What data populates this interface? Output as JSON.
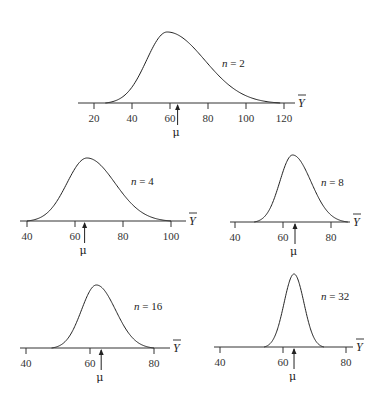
{
  "chart_data": [
    {
      "type": "line",
      "title": "n = 2",
      "n_label_var": "n",
      "n_value": 2,
      "xlabel": "Ȳ",
      "mu_label": "μ",
      "mu": 64,
      "mode": 58.5,
      "skew": "right",
      "ticks": [
        20,
        40,
        60,
        80,
        100,
        120
      ],
      "xlim": [
        17,
        125
      ],
      "curve_support": [
        26,
        118
      ],
      "layout": {
        "x0": 94,
        "units_per_px": 0.5263,
        "px_per_10": 19,
        "axis_y": 103,
        "axis_x_start": 78,
        "axis_x_end": 295,
        "peak_y": 32,
        "label_x": 222,
        "label_y": 67
      }
    },
    {
      "type": "line",
      "title": "n = 4",
      "n_label_var": "n",
      "n_value": 4,
      "xlabel": "Ȳ",
      "mu_label": "μ",
      "mu": 64,
      "mode": 65,
      "ticks": [
        40,
        60,
        80,
        100
      ],
      "xlim": [
        38,
        104
      ],
      "curve_support": [
        40,
        100
      ],
      "layout": {
        "x0": 27,
        "px_per_10": 24,
        "axis_y": 221,
        "axis_x_start": 20,
        "axis_x_end": 186,
        "peak_y": 158,
        "label_x": 131,
        "label_y": 185
      }
    },
    {
      "type": "line",
      "title": "n = 8",
      "n_label_var": "n",
      "n_value": 8,
      "xlabel": "Ȳ",
      "mu_label": "μ",
      "mu": 65,
      "mode": 64,
      "ticks": [
        40,
        60,
        80
      ],
      "xlim": [
        38,
        87
      ],
      "curve_support": [
        48,
        87
      ],
      "layout": {
        "x0": 235,
        "px_per_10": 24,
        "axis_y": 222,
        "axis_x_start": 230,
        "axis_x_end": 350,
        "peak_y": 155,
        "label_x": 321,
        "label_y": 186
      }
    },
    {
      "type": "line",
      "title": "n = 16",
      "n_label_var": "n",
      "n_value": 16,
      "xlabel": "Ȳ",
      "mu_label": "μ",
      "mu": 63.5,
      "mode": 62,
      "ticks": [
        40,
        60,
        80
      ],
      "xlim": [
        38,
        85
      ],
      "curve_support": [
        48,
        80
      ],
      "layout": {
        "x0": 26,
        "px_per_10": 32,
        "axis_y": 348,
        "axis_x_start": 20,
        "axis_x_end": 170,
        "peak_y": 285,
        "label_x": 134,
        "label_y": 310
      }
    },
    {
      "type": "line",
      "title": "n = 32",
      "n_label_var": "n",
      "n_value": 32,
      "xlabel": "Ȳ",
      "mu_label": "μ",
      "mu": 63.5,
      "mode": 63.5,
      "ticks": [
        40,
        60,
        80
      ],
      "xlim": [
        38,
        85
      ],
      "curve_support": [
        54,
        73
      ],
      "layout": {
        "x0": 220,
        "px_per_10": 31.5,
        "axis_y": 347,
        "axis_x_start": 214,
        "axis_x_end": 353,
        "peak_y": 274,
        "label_x": 321,
        "label_y": 300
      }
    }
  ]
}
